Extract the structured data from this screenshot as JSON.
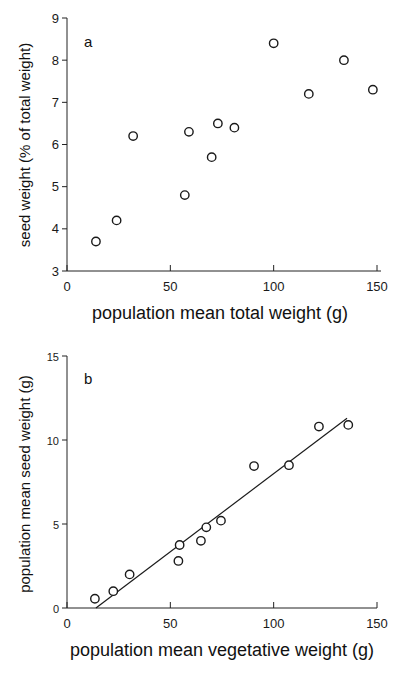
{
  "chart_data": [
    {
      "type": "scatter",
      "panel_label": "a",
      "title": "",
      "xlabel": "population mean total weight  (g)",
      "ylabel": "seed weight (% of total weight)",
      "xlim": [
        0,
        150
      ],
      "ylim": [
        3,
        9
      ],
      "xticks": [
        0,
        50,
        100,
        150
      ],
      "yticks": [
        3,
        4,
        5,
        6,
        7,
        8,
        9
      ],
      "grid": false,
      "legend": "none",
      "series": [
        {
          "name": "populations",
          "marker": "open-circle",
          "x": [
            14,
            24,
            32,
            57,
            59,
            70,
            73,
            81,
            100,
            117,
            134,
            148
          ],
          "y": [
            3.7,
            4.2,
            6.2,
            4.8,
            6.3,
            5.7,
            6.5,
            6.4,
            8.4,
            7.2,
            8.0,
            7.3
          ]
        }
      ]
    },
    {
      "type": "scatter",
      "panel_label": "b",
      "title": "",
      "xlabel": "population mean vegetative weight (g)",
      "ylabel": "population mean seed weight (g)",
      "xlim": [
        0,
        150
      ],
      "ylim": [
        0,
        15
      ],
      "xticks": [
        0,
        50,
        100,
        150
      ],
      "yticks": [
        0,
        5,
        10,
        15
      ],
      "grid": false,
      "legend": "none",
      "series": [
        {
          "name": "populations",
          "marker": "open-circle",
          "x": [
            13.5,
            22.4,
            30.3,
            53.9,
            54.5,
            64.8,
            67.4,
            74.5,
            90.5,
            107.4,
            121.9,
            136.1
          ],
          "y": [
            0.55,
            1.0,
            2.0,
            2.8,
            3.75,
            4.0,
            4.8,
            5.2,
            8.45,
            8.5,
            10.8,
            10.9
          ]
        }
      ],
      "fit_line": {
        "name": "regression",
        "x": [
          14,
          135.5
        ],
        "y": [
          0,
          11.3
        ]
      }
    }
  ]
}
